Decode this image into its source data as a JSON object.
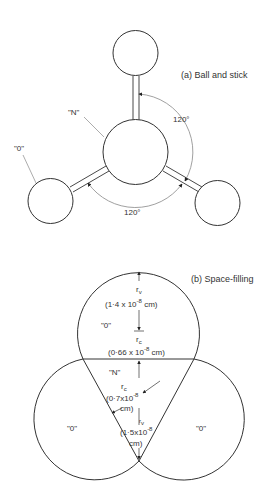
{
  "figure": {
    "panel_a": {
      "title": "(a) Ball and stick",
      "atoms": {
        "center": "\"N\"",
        "outer": "\"0\""
      },
      "angles": [
        "120°",
        "120°"
      ]
    },
    "panel_b": {
      "title": "(b) Space-filling",
      "atoms": {
        "center": "\"N\"",
        "top": "\"0\"",
        "left": "\"0\"",
        "right": "\"0\""
      },
      "oxygen": {
        "rv_label": "r",
        "rv_sub": "v",
        "rv_value": "(1·4 x 10",
        "rv_exp": "-8",
        "rv_unit": " cm)",
        "rc_label": "r",
        "rc_sub": "c",
        "rc_value": "(0·66 x 10",
        "rc_exp": "-8",
        "rc_unit": " cm)"
      },
      "nitrogen": {
        "rc_label": "r",
        "rc_sub": "c",
        "rc_value": "(0·7x10",
        "rc_exp": "-8",
        "rc_unit": "cm)",
        "rv_label": "r",
        "rv_sub": "v",
        "rv_value": "(1·5x10",
        "rv_exp": "-8",
        "rv_unit": "cm)"
      }
    },
    "colors": {
      "line": "#333333",
      "leader": "#888888",
      "background": "#ffffff"
    }
  }
}
